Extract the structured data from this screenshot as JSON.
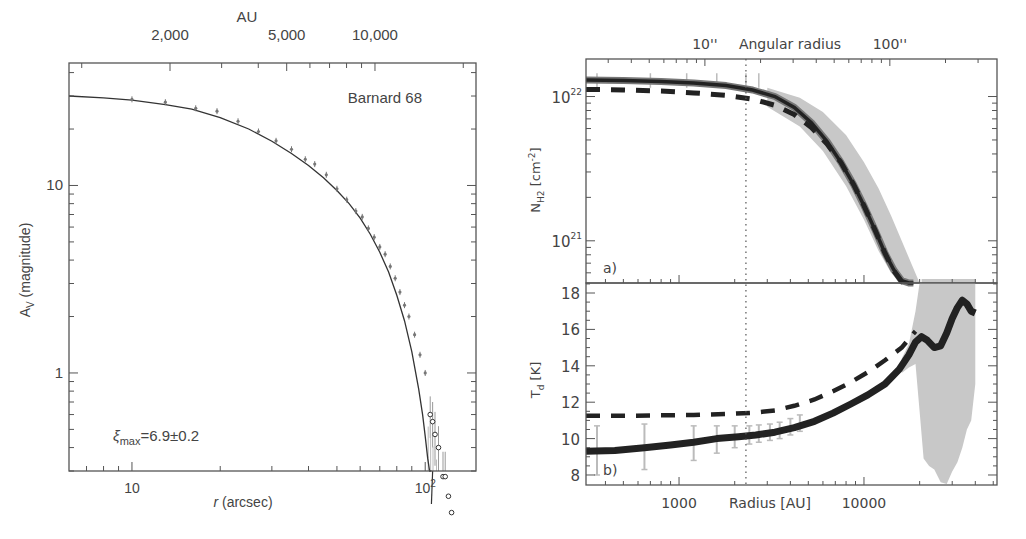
{
  "chart_data": [
    {
      "id": "left",
      "type": "scatter",
      "title": "Barnard 68",
      "annotation": "ξmax=6.9±0.2",
      "annotation_parts": {
        "sym": "ξ",
        "sub": "max",
        "rest": "=6.9±0.2"
      },
      "xlabel": "r (arcsec)",
      "xlabel_parts": {
        "italic": "r",
        "rest": " (arcsec)"
      },
      "ylabel": "Av (magnitude)",
      "ylabel_parts": {
        "main": "A",
        "sub": "V",
        "rest": " (magnitude)"
      },
      "top_axis_title": "AU",
      "xscale": "log",
      "yscale": "log",
      "xlim": [
        6.1,
        149
      ],
      "ylim": [
        0.3,
        45
      ],
      "xticks_major": [
        {
          "v": 10,
          "label": "10"
        },
        {
          "v": 100,
          "label": "10²"
        }
      ],
      "yticks_major": [
        {
          "v": 1,
          "label": "1"
        },
        {
          "v": 10,
          "label": "10"
        }
      ],
      "top_ticks": [
        {
          "au": 2000,
          "label": "2,000"
        },
        {
          "au": 5000,
          "label": "5,000"
        },
        {
          "au": 10000,
          "label": "10,000"
        }
      ],
      "model_curve": {
        "name": "Bonnor-Ebert fit",
        "x": [
          6.1,
          8,
          10,
          13,
          16,
          20,
          25,
          30,
          35,
          40,
          45,
          50,
          55,
          60,
          65,
          70,
          75,
          80,
          85,
          90,
          95,
          98,
          100,
          102,
          103.5,
          104.5,
          105
        ],
        "y": [
          30,
          29.3,
          28.5,
          27.0,
          25.5,
          23.0,
          20.0,
          17.2,
          14.8,
          12.8,
          11.0,
          9.4,
          8.0,
          6.7,
          5.5,
          4.4,
          3.45,
          2.6,
          1.9,
          1.3,
          0.82,
          0.6,
          0.46,
          0.35,
          0.28,
          0.22,
          0.2
        ]
      },
      "data_points": {
        "name": "Observed extinction",
        "x": [
          10,
          13,
          16.5,
          19.5,
          23,
          27,
          31,
          35,
          39,
          42,
          46,
          50,
          54,
          58,
          61,
          64,
          67,
          70,
          73,
          76,
          79,
          82,
          85,
          88,
          92,
          96,
          100
        ],
        "y": [
          28.8,
          27.8,
          25.8,
          24.9,
          22.0,
          19.4,
          17.3,
          15.6,
          13.8,
          13.0,
          11.4,
          9.6,
          8.4,
          7.3,
          6.8,
          5.9,
          5.3,
          4.7,
          4.3,
          3.7,
          3.2,
          2.7,
          2.3,
          2.0,
          1.6,
          1.25,
          1.0
        ]
      },
      "outer_points": {
        "name": "Outer points (open circles)",
        "x": [
          104,
          106,
          108,
          111,
          115,
          117,
          120,
          123
        ],
        "y": [
          0.6,
          0.55,
          0.47,
          0.4,
          0.28,
          0.28,
          0.22,
          0.18
        ],
        "err_lo": [
          0.15,
          0.15,
          0.15,
          0.12,
          0.1,
          0.1,
          0.08,
          0.06
        ],
        "err_hi": [
          0.15,
          0.15,
          0.15,
          0.12,
          0.1,
          0.1,
          0.08,
          0.06
        ]
      }
    },
    {
      "id": "right-top",
      "type": "line",
      "panel_label": "a)",
      "ylabel": "NH2 [cm-2]",
      "ylabel_parts": {
        "main": "N",
        "sub": "H2",
        "rest": " [cm",
        "sup": "-2",
        "end": "]"
      },
      "top_axis_title": "Angular radius",
      "top_ticks": [
        {
          "au": 1380,
          "label": "10''"
        },
        {
          "au": 13800,
          "label": "100''"
        }
      ],
      "xscale": "log",
      "yscale": "log",
      "xlim": [
        314,
        52400
      ],
      "ylim": [
        5.1e+20,
        1.82e+22
      ],
      "yticks_major": [
        {
          "v": 1e+21,
          "label": "10²¹"
        },
        {
          "v": 1e+22,
          "label": "10²²"
        }
      ],
      "vline_au": 2300,
      "series": [
        {
          "name": "Observed (solid)",
          "style": "solid-thick",
          "x": [
            314,
            500,
            800,
            1200,
            1800,
            2500,
            3300,
            4200,
            5200,
            6300,
            7500,
            8800,
            10000,
            11500,
            13000,
            14500,
            16000,
            17500,
            18500
          ],
          "y": [
            1.3e+22,
            1.29e+22,
            1.27e+22,
            1.24e+22,
            1.19e+22,
            1.11e+22,
            1e+22,
            8.4e+21,
            6.6e+21,
            4.9e+21,
            3.5e+21,
            2.45e+21,
            1.75e+21,
            1.18e+21,
            8.2e+20,
            6.3e+20,
            5.3e+20,
            5.1e+20,
            5.1e+20
          ]
        },
        {
          "name": "Model (dashed)",
          "style": "dashed",
          "x": [
            314,
            500,
            800,
            1200,
            1800,
            2500,
            3300,
            4200,
            5200,
            6300,
            7500,
            8800,
            10000,
            11500,
            13000,
            14500,
            16000,
            17500
          ],
          "y": [
            1.12e+22,
            1.11e+22,
            1.09e+22,
            1.06e+22,
            1.02e+22,
            9.6e+21,
            8.7e+21,
            7.5e+21,
            6.1e+21,
            4.7e+21,
            3.5e+21,
            2.45e+21,
            1.75e+21,
            1.18e+21,
            8.2e+20,
            6.2e+20,
            5.2e+20,
            5.1e+20
          ]
        }
      ],
      "error_band": {
        "x": [
          3000,
          4500,
          6000,
          8000,
          10000,
          12000,
          14000,
          16000,
          18000,
          20000
        ],
        "lo": [
          8.5e+21,
          6.2e+21,
          4.2e+21,
          2.4e+21,
          1.4e+21,
          8.5e+20,
          6e+20,
          5.1e+20,
          5.1e+20,
          5.1e+20
        ],
        "hi": [
          1.15e+22,
          9.8e+21,
          7.8e+21,
          5.4e+21,
          3.5e+21,
          2.3e+21,
          1.5e+21,
          1e+21,
          7e+20,
          5.1e+20
        ]
      }
    },
    {
      "id": "right-bottom",
      "type": "line",
      "panel_label": "b)",
      "xlabel": "Radius [AU]",
      "ylabel": "Td [K]",
      "ylabel_parts": {
        "main": "T",
        "sub": "d",
        "rest": " [K]"
      },
      "xscale": "log",
      "yscale": "linear",
      "xlim": [
        314,
        52400
      ],
      "ylim": [
        7.45,
        18.55
      ],
      "xticks_major": [
        {
          "v": 1000,
          "label": "1000"
        },
        {
          "v": 10000,
          "label": "10000"
        }
      ],
      "yticks_major": [
        {
          "v": 8,
          "label": "8"
        },
        {
          "v": 10,
          "label": "10"
        },
        {
          "v": 12,
          "label": "12"
        },
        {
          "v": 14,
          "label": "14"
        },
        {
          "v": 16,
          "label": "16"
        },
        {
          "v": 18,
          "label": "18"
        }
      ],
      "vline_au": 2300,
      "series": [
        {
          "name": "Observed (solid)",
          "style": "solid-thick",
          "x": [
            314,
            450,
            650,
            900,
            1200,
            1600,
            2100,
            2600,
            3300,
            4200,
            5400,
            6800,
            8500,
            10500,
            13000,
            15500,
            17500,
            19000,
            20500,
            22000,
            24000,
            26000,
            28000,
            30000,
            32000,
            34000,
            36000,
            38000,
            40000
          ],
          "y": [
            9.3,
            9.35,
            9.5,
            9.65,
            9.8,
            10.0,
            10.1,
            10.2,
            10.35,
            10.6,
            10.95,
            11.4,
            11.9,
            12.4,
            13.0,
            13.8,
            14.6,
            15.3,
            15.6,
            15.4,
            15.0,
            15.1,
            15.8,
            16.6,
            17.2,
            17.6,
            17.4,
            17.0,
            16.9
          ]
        },
        {
          "name": "Model (dashed)",
          "style": "dashed",
          "x": [
            314,
            500,
            800,
            1200,
            1800,
            2500,
            3300,
            4200,
            5400,
            6800,
            8500,
            10500,
            13000,
            16000,
            19000
          ],
          "y": [
            11.25,
            11.25,
            11.28,
            11.3,
            11.35,
            11.42,
            11.55,
            11.8,
            12.15,
            12.6,
            13.1,
            13.65,
            14.3,
            15.0,
            15.9
          ]
        }
      ],
      "error_bars": {
        "x": [
          360,
          650,
          1200,
          1600,
          2000,
          2400,
          2700,
          3100,
          3500,
          4000,
          4500
        ],
        "lo": [
          8.0,
          8.3,
          8.8,
          9.2,
          9.5,
          9.7,
          9.8,
          9.9,
          10.0,
          10.2,
          10.4
        ],
        "hi": [
          10.7,
          10.8,
          10.7,
          10.7,
          10.7,
          10.7,
          10.75,
          10.8,
          10.9,
          11.1,
          11.3
        ]
      },
      "outer_band": {
        "x": [
          16000,
          17500,
          19000,
          20000,
          21000,
          22500,
          24000,
          26000,
          28000,
          30000,
          32000,
          34000,
          36000,
          38000,
          40000
        ],
        "lo": [
          13.6,
          13.9,
          14.1,
          11.5,
          8.9,
          8.5,
          8.3,
          7.6,
          7.5,
          8.2,
          8.7,
          9.5,
          10.5,
          11.0,
          13.0
        ],
        "hi": [
          14.4,
          15.2,
          17.0,
          18.55,
          18.55,
          18.55,
          18.55,
          18.55,
          18.55,
          18.55,
          18.55,
          18.55,
          18.55,
          18.55,
          18.55
        ]
      }
    }
  ],
  "colors": {
    "axis": "#555555",
    "text": "#444444",
    "curve": "#333333",
    "data_point": "#777777",
    "band": "#c8c8c8",
    "thick_line": "#222222"
  }
}
